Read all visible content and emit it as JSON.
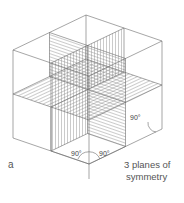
{
  "figure": {
    "panel_letter": "a",
    "caption_line1": "3 planes of",
    "caption_line2": "symmetry",
    "angles": {
      "front_left": "90°",
      "front_right": "90°",
      "right_side": "90°"
    },
    "line_color": "#6a6a6a",
    "hatch_color": "#8a8a8a"
  }
}
